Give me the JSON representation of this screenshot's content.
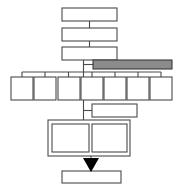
{
  "diagram": {
    "type": "flowchart",
    "canvas": {
      "width": 180,
      "height": 189,
      "background": "#ffffff"
    },
    "colors": {
      "box_fill": "#ffffff",
      "box_stroke": "#4a4a4a",
      "shaded_fill": "#8c8c8c",
      "shaded_stroke": "#3a3a3a",
      "connector": "#4a4a4a",
      "arrow": "#000000"
    },
    "nodes": [
      {
        "id": "top-1",
        "label": "",
        "x": 62,
        "y": 8,
        "w": 55,
        "h": 13,
        "style": "plain"
      },
      {
        "id": "top-2",
        "label": "",
        "x": 62,
        "y": 28,
        "w": 55,
        "h": 13,
        "style": "plain"
      },
      {
        "id": "top-3",
        "label": "",
        "x": 62,
        "y": 47,
        "w": 55,
        "h": 13,
        "style": "plain"
      },
      {
        "id": "shaded",
        "label": "",
        "x": 93,
        "y": 60,
        "w": 79,
        "h": 9,
        "style": "shaded"
      },
      {
        "id": "branch-1",
        "label": "",
        "x": 11,
        "y": 77,
        "w": 22,
        "h": 23,
        "style": "plain"
      },
      {
        "id": "branch-2",
        "label": "",
        "x": 34,
        "y": 77,
        "w": 22,
        "h": 23,
        "style": "plain"
      },
      {
        "id": "branch-3",
        "label": "",
        "x": 58,
        "y": 77,
        "w": 22,
        "h": 23,
        "style": "plain"
      },
      {
        "id": "branch-4",
        "label": "",
        "x": 81,
        "y": 77,
        "w": 22,
        "h": 23,
        "style": "plain"
      },
      {
        "id": "branch-5",
        "label": "",
        "x": 104,
        "y": 77,
        "w": 22,
        "h": 23,
        "style": "plain"
      },
      {
        "id": "branch-6",
        "label": "",
        "x": 127,
        "y": 77,
        "w": 22,
        "h": 23,
        "style": "plain"
      },
      {
        "id": "branch-7",
        "label": "",
        "x": 150,
        "y": 77,
        "w": 22,
        "h": 23,
        "style": "plain"
      },
      {
        "id": "offset",
        "label": "",
        "x": 92,
        "y": 104,
        "w": 45,
        "h": 13,
        "style": "plain"
      },
      {
        "id": "group-box",
        "label": "",
        "x": 48,
        "y": 120,
        "w": 82,
        "h": 36,
        "style": "container"
      },
      {
        "id": "inner-left",
        "label": "",
        "x": 52,
        "y": 124,
        "w": 37,
        "h": 28,
        "style": "plain"
      },
      {
        "id": "inner-right",
        "label": "",
        "x": 92,
        "y": 124,
        "w": 35,
        "h": 28,
        "style": "plain"
      },
      {
        "id": "bottom",
        "label": "",
        "x": 62,
        "y": 171,
        "w": 59,
        "h": 12,
        "style": "plain"
      }
    ],
    "connectors": [
      {
        "id": "c-top1-top2",
        "path": "M 89.5 21 L 89.5 28"
      },
      {
        "id": "c-top2-top3",
        "path": "M 89.5 41 L 89.5 47"
      },
      {
        "id": "c-top3-trunk",
        "path": "M 83.5 60 L 83.5 77"
      },
      {
        "id": "c-trunk-shaded",
        "path": "M 83.5 64.5 L 93 64.5"
      },
      {
        "id": "c-bus",
        "path": "M 22 72 L 161 72"
      },
      {
        "id": "c-drop-1",
        "path": "M 22 72 L 22 77"
      },
      {
        "id": "c-drop-2",
        "path": "M 45 72 L 45 77"
      },
      {
        "id": "c-drop-3",
        "path": "M 68.5 72 L 68.5 77"
      },
      {
        "id": "c-drop-4",
        "path": "M 92 72 L 92 77"
      },
      {
        "id": "c-drop-5",
        "path": "M 115 72 L 115 77"
      },
      {
        "id": "c-drop-6",
        "path": "M 138 72 L 138 77"
      },
      {
        "id": "c-drop-7",
        "path": "M 161 72 L 161 77"
      },
      {
        "id": "c-center-down",
        "path": "M 83.5 100 L 83.5 120"
      },
      {
        "id": "c-center-offset",
        "path": "M 83.5 110.5 L 92 110.5"
      },
      {
        "id": "c-group-bus",
        "path": "M 70 124 L 109 124"
      },
      {
        "id": "c-group-left",
        "path": "M 70 124 L 70 128"
      },
      {
        "id": "c-group-right",
        "path": "M 109 124 L 109 128"
      },
      {
        "id": "c-arrow-stem",
        "path": "M 91 156 L 91 160"
      },
      {
        "id": "c-arrow-tail",
        "path": "M 91 168 L 91 171"
      }
    ],
    "arrows": [
      {
        "id": "arrow-down",
        "points": "83,158 99,158 91,172",
        "color": "#000000"
      }
    ]
  }
}
